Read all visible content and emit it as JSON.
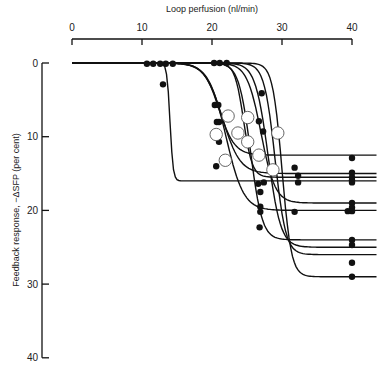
{
  "chart_data": {
    "type": "line",
    "title": "",
    "xlabel": "Loop perfusion (nl/min)",
    "ylabel": "Feedback response, −ΔSFP (per cent)",
    "xlim": [
      0,
      40
    ],
    "ylim": [
      0,
      40
    ],
    "y_inverted": true,
    "x_axis_position": "top",
    "xticks": [
      0,
      10,
      20,
      30,
      40
    ],
    "yticks": [
      0,
      10,
      20,
      30,
      40
    ],
    "grid": false,
    "legend": null,
    "series": [
      {
        "name": "curve-1",
        "plateau": 16,
        "midpoint": 14,
        "slope": 4.5,
        "start": 0
      },
      {
        "name": "curve-2",
        "plateau": 12.5,
        "midpoint": 21,
        "slope": 0.9,
        "start": 0
      },
      {
        "name": "curve-3",
        "plateau": 15,
        "midpoint": 21.5,
        "slope": 0.8,
        "start": 0
      },
      {
        "name": "curve-4",
        "plateau": 20,
        "midpoint": 22,
        "slope": 0.8,
        "start": 0
      },
      {
        "name": "curve-5",
        "plateau": 15.5,
        "midpoint": 24.5,
        "slope": 1.6,
        "start": 0
      },
      {
        "name": "curve-6",
        "plateau": 24,
        "midpoint": 25.5,
        "slope": 1.2,
        "start": 0
      },
      {
        "name": "curve-7",
        "plateau": 19,
        "midpoint": 27,
        "slope": 1.0,
        "start": 0
      },
      {
        "name": "curve-8",
        "plateau": 25,
        "midpoint": 28,
        "slope": 1.1,
        "start": 0
      },
      {
        "name": "curve-9",
        "plateau": 26,
        "midpoint": 29,
        "slope": 1.3,
        "start": 0
      },
      {
        "name": "curve-10",
        "plateau": 29,
        "midpoint": 30,
        "slope": 1.5,
        "start": 0
      }
    ],
    "filled_points": [
      [
        10.7,
        0.1
      ],
      [
        11.6,
        0.1
      ],
      [
        12.6,
        0.1
      ],
      [
        13.4,
        0.1
      ],
      [
        14.4,
        0.1
      ],
      [
        20.3,
        0
      ],
      [
        21.1,
        0
      ],
      [
        22.1,
        0
      ],
      [
        13,
        2.9
      ],
      [
        27.1,
        4.1
      ],
      [
        20.4,
        5.7
      ],
      [
        20.9,
        5.7
      ],
      [
        20.7,
        8.0
      ],
      [
        21.0,
        8.0
      ],
      [
        21.0,
        10.7
      ],
      [
        20.6,
        14.0
      ],
      [
        26.7,
        7.9
      ],
      [
        27.3,
        9.3
      ],
      [
        26.7,
        12.7
      ],
      [
        26.6,
        16.4
      ],
      [
        27.4,
        16.2
      ],
      [
        26.9,
        17.5
      ],
      [
        26.9,
        19.5
      ],
      [
        26.9,
        20.2
      ],
      [
        26.8,
        22.3
      ],
      [
        31.8,
        14.2
      ],
      [
        32.3,
        15.3
      ],
      [
        32.3,
        16.2
      ],
      [
        31.8,
        20.2
      ],
      [
        40,
        12.9
      ],
      [
        40,
        14.9
      ],
      [
        40,
        15.5
      ],
      [
        40,
        15.9
      ],
      [
        40,
        16.2
      ],
      [
        40,
        19.0
      ],
      [
        40,
        19.6
      ],
      [
        40,
        20.1
      ],
      [
        39.4,
        20.1
      ],
      [
        40,
        24.0
      ],
      [
        40,
        24.7
      ],
      [
        40,
        27.1
      ],
      [
        40,
        29.0
      ]
    ],
    "open_points": [
      [
        20.6,
        9.7
      ],
      [
        21.9,
        13.2
      ],
      [
        22.3,
        7.2
      ],
      [
        23.7,
        9.5
      ],
      [
        25.1,
        10.7
      ],
      [
        25.1,
        7.4
      ],
      [
        26.7,
        12.5
      ],
      [
        29.4,
        9.5
      ],
      [
        28.7,
        14.5
      ]
    ]
  }
}
